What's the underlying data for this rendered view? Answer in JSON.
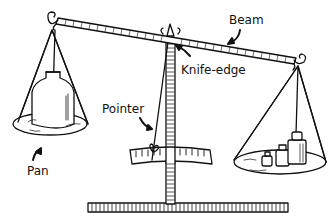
{
  "diagram": {
    "labels": {
      "beam": "Beam",
      "knife_edge": "Knife-edge",
      "pointer": "Pointer",
      "pan": "Pan"
    },
    "colors": {
      "ink": "#111111",
      "background": "#ffffff"
    }
  }
}
